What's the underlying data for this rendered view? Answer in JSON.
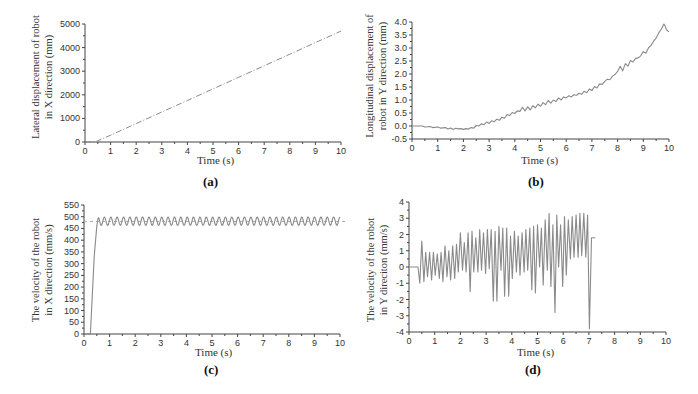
{
  "chart_data": [
    {
      "id": "a",
      "type": "line",
      "caption": "(a)",
      "title": "",
      "xlabel": "Time (s)",
      "ylabel_lines": [
        "Lateral displacement of robot",
        "in X direction (mm)"
      ],
      "xlim": [
        0,
        10
      ],
      "ylim": [
        0,
        5000
      ],
      "xticks": [
        0,
        1,
        2,
        3,
        4,
        5,
        6,
        7,
        8,
        9,
        10
      ],
      "yticks": [
        0,
        1000,
        2000,
        3000,
        4000,
        5000
      ],
      "grid": false,
      "line_style": "dash-dot",
      "series": [
        {
          "name": "X displacement",
          "x": [
            0,
            0.4,
            1,
            2,
            3,
            4,
            5,
            6,
            7,
            8,
            9,
            10
          ],
          "y": [
            0,
            0,
            290,
            780,
            1270,
            1760,
            2250,
            2740,
            3230,
            3720,
            4210,
            4700
          ]
        }
      ]
    },
    {
      "id": "b",
      "type": "line",
      "caption": "(b)",
      "title": "",
      "xlabel": "Time (s)",
      "ylabel_lines": [
        "Longitudinal displacement of",
        "robot in Y direction (mm)"
      ],
      "xlim": [
        0,
        10
      ],
      "ylim": [
        -0.5,
        4.0
      ],
      "xticks": [
        0,
        1,
        2,
        3,
        4,
        5,
        6,
        7,
        8,
        9,
        10
      ],
      "yticks": [
        -0.5,
        0.0,
        0.5,
        1.0,
        1.5,
        2.0,
        2.5,
        3.0,
        3.5,
        4.0
      ],
      "ytick_format": 1,
      "grid": false,
      "line_style": "solid",
      "series": [
        {
          "name": "Y displacement",
          "x": [
            0,
            0.4,
            0.5,
            0.7,
            0.8,
            1.0,
            1.1,
            1.3,
            1.4,
            1.5,
            1.6,
            1.7,
            1.8,
            1.9,
            2.0,
            2.1,
            2.2,
            2.3,
            2.4,
            2.5,
            2.6,
            2.7,
            2.8,
            2.9,
            3.0,
            3.1,
            3.2,
            3.3,
            3.4,
            3.5,
            3.6,
            3.7,
            3.8,
            3.9,
            4.0,
            4.1,
            4.2,
            4.3,
            4.4,
            4.5,
            4.6,
            4.7,
            4.8,
            4.9,
            5.0,
            5.1,
            5.2,
            5.3,
            5.4,
            5.5,
            5.6,
            5.7,
            5.8,
            5.9,
            6.0,
            6.1,
            6.2,
            6.3,
            6.4,
            6.5,
            6.6,
            6.7,
            6.8,
            6.9,
            7.0,
            7.1,
            7.2,
            7.3,
            7.4,
            7.5,
            7.6,
            7.7,
            7.8,
            7.9,
            8.0,
            8.1,
            8.2,
            8.3,
            8.4,
            8.5,
            8.6,
            8.7,
            8.8,
            8.9,
            9.0,
            9.1,
            9.2,
            9.3,
            9.4,
            9.5,
            9.6,
            9.7,
            9.8,
            9.85,
            9.9,
            10.0
          ],
          "y": [
            0,
            0,
            -0.04,
            -0.02,
            -0.06,
            -0.04,
            -0.08,
            -0.06,
            -0.12,
            -0.08,
            -0.14,
            -0.09,
            -0.11,
            -0.1,
            -0.13,
            -0.1,
            -0.12,
            -0.06,
            -0.08,
            0.02,
            0.0,
            0.08,
            0.05,
            0.15,
            0.1,
            0.2,
            0.16,
            0.26,
            0.22,
            0.34,
            0.3,
            0.44,
            0.4,
            0.52,
            0.48,
            0.58,
            0.56,
            0.72,
            0.58,
            0.74,
            0.62,
            0.78,
            0.7,
            0.84,
            0.76,
            0.9,
            0.82,
            0.98,
            0.88,
            1.0,
            0.94,
            1.08,
            1.0,
            1.12,
            1.08,
            1.16,
            1.12,
            1.2,
            1.18,
            1.26,
            1.22,
            1.34,
            1.28,
            1.42,
            1.36,
            1.52,
            1.46,
            1.62,
            1.6,
            1.72,
            1.8,
            1.78,
            1.92,
            1.98,
            2.1,
            2.3,
            2.12,
            2.4,
            2.3,
            2.52,
            2.46,
            2.6,
            2.62,
            2.7,
            2.86,
            2.8,
            3.0,
            3.1,
            3.26,
            3.38,
            3.58,
            3.72,
            3.92,
            3.85,
            3.7,
            3.62
          ]
        }
      ]
    },
    {
      "id": "c",
      "type": "line",
      "caption": "(c)",
      "title": "",
      "xlabel": "Time (s)",
      "ylabel_lines": [
        "The velocity of the robot",
        "in X direction (mm/s)"
      ],
      "xlim": [
        0,
        10
      ],
      "ylim": [
        0,
        550
      ],
      "xticks": [
        0,
        1,
        2,
        3,
        4,
        5,
        6,
        7,
        8,
        9,
        10
      ],
      "yticks": [
        0,
        50,
        100,
        150,
        200,
        250,
        300,
        350,
        400,
        450,
        500,
        550
      ],
      "grid": false,
      "line_style": "solid",
      "reference_line": {
        "y": 480,
        "style": "dashed"
      },
      "series": [
        {
          "name": "X velocity",
          "description": "step from 0 at t≈0.25s to ~480 at t≈0.55s, then oscillates between ~460 and ~500 with ~38 cycles until t=10",
          "x": [
            0,
            0.25,
            0.4,
            0.5,
            0.55
          ],
          "y": [
            0,
            0,
            330,
            460,
            495
          ],
          "oscillation": {
            "start": 0.55,
            "end": 10,
            "min": 462,
            "max": 500,
            "cycles": 38
          }
        }
      ]
    },
    {
      "id": "d",
      "type": "line",
      "caption": "(d)",
      "title": "",
      "xlabel": "Time (s)",
      "ylabel_lines": [
        "The velocity of the robot",
        "in Y direciton (mm/s)"
      ],
      "xlim": [
        0,
        10
      ],
      "ylim": [
        -4,
        4
      ],
      "xticks": [
        0,
        1,
        2,
        3,
        4,
        5,
        6,
        7,
        8,
        9,
        10
      ],
      "yticks": [
        -4,
        -3,
        -2,
        -1,
        0,
        1,
        2,
        3,
        4
      ],
      "grid": false,
      "line_style": "solid",
      "series": [
        {
          "name": "Y velocity",
          "x": [
            0,
            0.3,
            0.35,
            0.42,
            0.5,
            0.58,
            0.65,
            0.72,
            0.8,
            0.88,
            0.95,
            1.02,
            1.1,
            1.18,
            1.25,
            1.32,
            1.4,
            1.48,
            1.55,
            1.62,
            1.7,
            1.78,
            1.85,
            1.92,
            2.0,
            2.08,
            2.15,
            2.22,
            2.3,
            2.38,
            2.45,
            2.52,
            2.6,
            2.68,
            2.75,
            2.82,
            2.9,
            2.98,
            3.05,
            3.12,
            3.2,
            3.28,
            3.35,
            3.42,
            3.5,
            3.58,
            3.65,
            3.72,
            3.8,
            3.88,
            3.95,
            4.02,
            4.1,
            4.18,
            4.25,
            4.32,
            4.4,
            4.48,
            4.55,
            4.62,
            4.7,
            4.78,
            4.85,
            4.92,
            5.0,
            5.08,
            5.15,
            5.22,
            5.3,
            5.38,
            5.45,
            5.52,
            5.6,
            5.68,
            5.75,
            5.82,
            5.9,
            5.98,
            6.05,
            6.12,
            6.2,
            6.28,
            6.35,
            6.42,
            6.5,
            6.58,
            6.65,
            6.72,
            6.8,
            6.88,
            6.95,
            7.02,
            7.1,
            7.18,
            7.25,
            7.32,
            7.4,
            7.48,
            7.55,
            7.62,
            7.7,
            7.78,
            7.85,
            7.92,
            8.0,
            8.08,
            8.15,
            8.22,
            8.3,
            8.38,
            8.45,
            8.52,
            8.6,
            8.68,
            8.75,
            8.82,
            8.9,
            8.98,
            9.05,
            9.12,
            9.2,
            9.28,
            9.35,
            9.42,
            9.5,
            9.58,
            9.65,
            9.72,
            9.8,
            9.85,
            9.9,
            9.95,
            10.0
          ],
          "y": [
            0,
            0,
            0,
            -1.0,
            1.6,
            -0.9,
            0.9,
            -0.6,
            0.9,
            -0.8,
            0.9,
            -0.5,
            0.8,
            -0.7,
            0.9,
            -0.9,
            1.3,
            -0.6,
            1.0,
            -0.8,
            1.3,
            -0.7,
            1.4,
            -0.3,
            2.1,
            -0.2,
            1.5,
            -0.3,
            2.1,
            -1.5,
            2.2,
            -0.3,
            1.8,
            -0.3,
            2.3,
            -0.2,
            2.1,
            -0.4,
            2.3,
            -0.1,
            2.3,
            -2.1,
            2.2,
            -2.1,
            2.5,
            -0.2,
            2.4,
            -1.8,
            2.4,
            -1.8,
            1.9,
            -0.7,
            2.2,
            -0.3,
            1.9,
            -0.5,
            2.1,
            -0.3,
            2.3,
            -0.2,
            2.4,
            -1.4,
            2.5,
            -1.6,
            2.6,
            0.0,
            2.4,
            -1.1,
            2.9,
            -0.2,
            3.3,
            -1.2,
            2.6,
            -2.8,
            3.2,
            0.0,
            2.6,
            -1.2,
            3.1,
            -0.5,
            2.9,
            0.5,
            3.1,
            0.6,
            3.2,
            0.6,
            3.3,
            0.7,
            3.3,
            0.6,
            3.2,
            -3.8,
            1.8,
            1.8,
            1.8
          ]
        }
      ]
    }
  ],
  "panels": {
    "a": {
      "caption": "(a)",
      "xlabel": "Time (s)",
      "ylabel1": "Lateral displacement of robot",
      "ylabel2": "in X direction (mm)"
    },
    "b": {
      "caption": "(b)",
      "xlabel": "Time (s)",
      "ylabel1": "Longitudinal displacement of",
      "ylabel2": "robot in Y direction (mm)"
    },
    "c": {
      "caption": "(c)",
      "xlabel": "Time (s)",
      "ylabel1": "The velocity of the robot",
      "ylabel2": "in X direction (mm/s)"
    },
    "d": {
      "caption": "(d)",
      "xlabel": "Time (s)",
      "ylabel1": "The velocity of the robot",
      "ylabel2": "in Y direciton (mm/s)"
    }
  },
  "colors": {
    "axis": "#444444",
    "line": "#8a8a8a",
    "text": "#333333"
  }
}
